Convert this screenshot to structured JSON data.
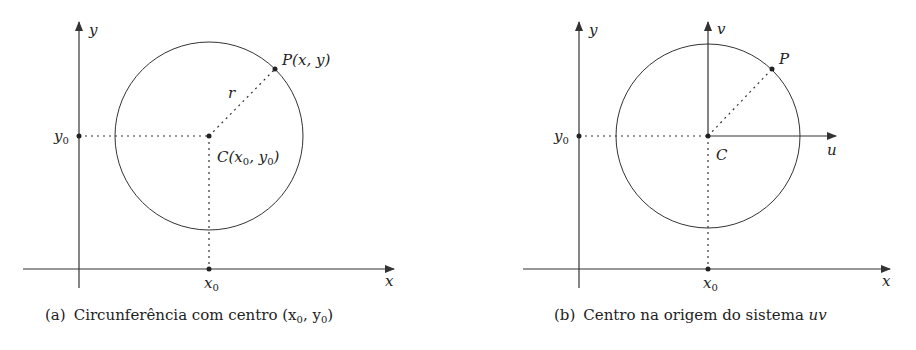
{
  "panels": [
    {
      "id": "a",
      "caption_tag": "(a)",
      "caption_text": "Circunferência com centro (x",
      "caption_tail_sep": ", y",
      "caption_tail_end": ")",
      "caption_full": "(a) Circunferência com centro (x0, y0)",
      "axis_x_label": "x",
      "axis_y_label": "y",
      "tick_x_label": "x",
      "tick_x_sub": "0",
      "tick_y_label": "y",
      "tick_y_sub": "0",
      "point_p_label": "P(x, y)",
      "radius_label": "r",
      "center_label_c": "C(x",
      "center_label_mid": ", y",
      "center_label_end": ")",
      "center_full": "C(x0, y0)"
    },
    {
      "id": "b",
      "caption_tag": "(b)",
      "caption_text": "Centro na origem do sistema ",
      "caption_italic": "uv",
      "caption_full": "(b) Centro na origem do sistema uv",
      "axis_x_label": "x",
      "axis_y_label": "y",
      "axis_u_label": "u",
      "axis_v_label": "v",
      "tick_x_label": "x",
      "tick_x_sub": "0",
      "tick_y_label": "y",
      "tick_y_sub": "0",
      "point_p_label": "P",
      "center_label": "C"
    }
  ],
  "colors": {
    "stroke": "#333333",
    "text": "#222222",
    "background": "#ffffff"
  }
}
